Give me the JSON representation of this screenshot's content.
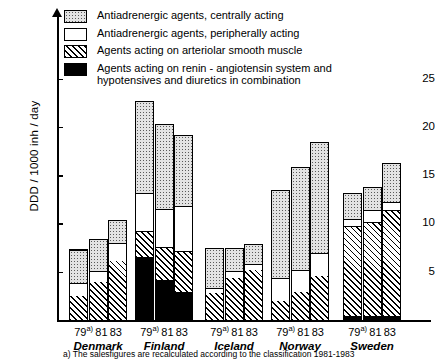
{
  "axes": {
    "y_title": "DDD / 1000 inh / day",
    "y_ticks": [
      5,
      10,
      15,
      20,
      25
    ]
  },
  "legend": [
    {
      "pattern": "dotted",
      "label": "Antiadrenergic agents, centrally acting"
    },
    {
      "pattern": "white",
      "label": "Antiadrenergic agents, peripherally acting"
    },
    {
      "pattern": "hatched",
      "label": "Agents acting on arteriolar smooth muscle"
    },
    {
      "pattern": "black",
      "label": "Agents acting on renin - angiotensin system and\nhypotensives and diuretics in combination"
    }
  ],
  "footnote": "a) The salesfigures are recalculated according to the classification  1981-1983",
  "year_labels": [
    "79",
    "81",
    "83"
  ],
  "year_sup": "a)",
  "chart_data": {
    "type": "bar",
    "subtype": "stacked-grouped",
    "title": "",
    "xlabel": "",
    "ylabel": "DDD / 1000 inh / day",
    "ylim": [
      0,
      27
    ],
    "grid": false,
    "legend_position": "top",
    "categories": [
      "Denmark",
      "Finland",
      "Iceland",
      "Norway",
      "Sweden"
    ],
    "subcategories": [
      "79",
      "81",
      "83"
    ],
    "series": [
      {
        "name": "Agents acting on renin - angiotensin system and hypotensives and diuretics in combination",
        "pattern": "black",
        "values": [
          [
            0.0,
            0.0,
            0.0
          ],
          [
            6.5,
            4.1,
            2.9
          ],
          [
            0.0,
            0.0,
            0.0
          ],
          [
            0.0,
            0.0,
            0.0
          ],
          [
            0.4,
            0.4,
            0.4
          ]
        ]
      },
      {
        "name": "Agents acting on arteriolar smooth muscle",
        "pattern": "hatched",
        "values": [
          [
            2.5,
            3.9,
            6.1
          ],
          [
            2.7,
            3.5,
            4.2
          ],
          [
            2.8,
            4.4,
            5.2
          ],
          [
            2.0,
            2.9,
            4.6
          ],
          [
            9.3,
            9.7,
            11.0
          ]
        ]
      },
      {
        "name": "Antiadrenergic agents, peripherally acting",
        "pattern": "white",
        "values": [
          [
            1.3,
            1.2,
            1.9
          ],
          [
            4.0,
            3.9,
            4.7
          ],
          [
            0.5,
            0.7,
            0.6
          ],
          [
            2.4,
            2.3,
            2.3
          ],
          [
            0.8,
            1.3,
            0.8
          ]
        ]
      },
      {
        "name": "Antiadrenergic agents, centrally acting",
        "pattern": "dotted",
        "values": [
          [
            3.5,
            3.3,
            2.4
          ],
          [
            9.5,
            8.8,
            7.4
          ],
          [
            4.2,
            2.4,
            2.1
          ],
          [
            9.1,
            10.6,
            11.5
          ],
          [
            2.6,
            2.4,
            4.1
          ]
        ]
      }
    ],
    "totals": [
      [
        7.3,
        8.4,
        10.4
      ],
      [
        22.7,
        20.3,
        19.2
      ],
      [
        7.5,
        7.5,
        7.9
      ],
      [
        13.5,
        15.8,
        18.4
      ],
      [
        13.1,
        13.8,
        16.3
      ]
    ]
  }
}
